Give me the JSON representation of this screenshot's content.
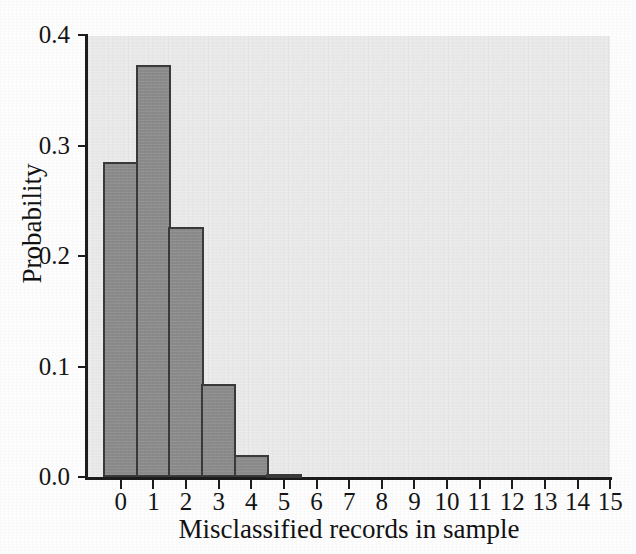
{
  "chart_data": {
    "type": "bar",
    "title": "",
    "subtitle": "",
    "xlabel": "Misclassified records in sample",
    "ylabel": "Probability",
    "categories": [
      "0",
      "1",
      "2",
      "3",
      "4",
      "5",
      "6",
      "7",
      "8",
      "9",
      "10",
      "11",
      "12",
      "13",
      "14",
      "15"
    ],
    "values": [
      0.285,
      0.373,
      0.226,
      0.084,
      0.02,
      0.003,
      0.0,
      0.0,
      0.0,
      0.0,
      0.0,
      0.0,
      0.0,
      0.0,
      0.0,
      0.0
    ],
    "xlim": [
      -0.5,
      15.5
    ],
    "ylim": [
      0.0,
      0.4
    ],
    "y_ticks": [
      "0.0",
      "0.1",
      "0.2",
      "0.3",
      "0.4"
    ],
    "y_tick_values": [
      0.0,
      0.1,
      0.2,
      0.3,
      0.4
    ],
    "grid": false,
    "legend": null,
    "bar_fill_color": "#8d8d8d",
    "bar_edge_color": "#3a3a3a",
    "plot_background_color": "#ececec",
    "axis_color": "#1c1c1c"
  }
}
